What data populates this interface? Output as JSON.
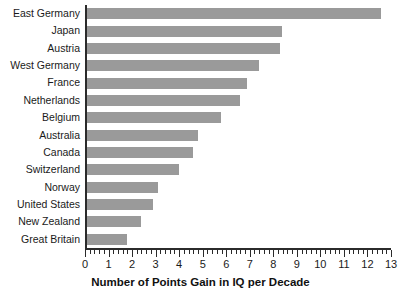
{
  "chart_data": {
    "type": "bar",
    "orientation": "horizontal",
    "title": "",
    "xlabel": "Number of Points Gain in IQ per Decade",
    "ylabel": "",
    "xlim": [
      0,
      13
    ],
    "grid": false,
    "legend": null,
    "bar_color": "#9a9a9a",
    "axis_color": "#2b2b2b",
    "xticks": [
      0,
      1,
      2,
      3,
      4,
      5,
      6,
      7,
      8,
      9,
      10,
      11,
      12,
      13
    ],
    "xtick_labels": [
      "0",
      "1",
      "2",
      "3",
      "4",
      "5",
      "6",
      "7",
      "8",
      "9",
      "10",
      "11",
      "12",
      "13"
    ],
    "minor_tick_step": 0.2,
    "categories": [
      "East Germany",
      "Japan",
      "Austria",
      "West Germany",
      "France",
      "Netherlands",
      "Belgium",
      "Australia",
      "Canada",
      "Switzerland",
      "Norway",
      "United States",
      "New Zealand",
      "Great Britain"
    ],
    "values": [
      12.5,
      8.3,
      8.2,
      7.3,
      6.8,
      6.5,
      5.7,
      4.7,
      4.5,
      3.9,
      3.0,
      2.8,
      2.3,
      1.7
    ]
  }
}
